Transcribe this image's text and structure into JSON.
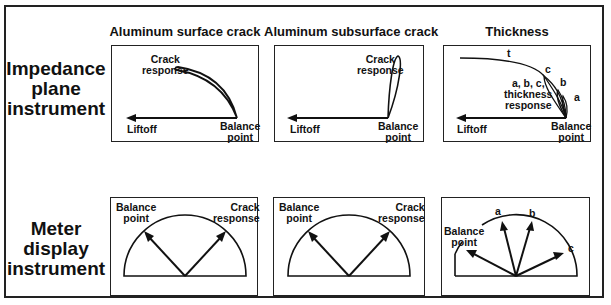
{
  "row_labels": {
    "impedance": [
      "Impedance",
      "plane",
      "instrument"
    ],
    "meter": [
      "Meter",
      "display",
      "instrument"
    ]
  },
  "column_titles": [
    "Aluminum surface crack",
    "Aluminum subsurface crack",
    "Thickness"
  ],
  "impedance_panels": {
    "surface": {
      "crack": [
        "Crack",
        "response"
      ],
      "liftoff": "Liftoff",
      "balance": [
        "Balance",
        "point"
      ]
    },
    "subsurface": {
      "crack": [
        "Crack",
        "response"
      ],
      "liftoff": "Liftoff",
      "balance": [
        "Balance",
        "point"
      ]
    },
    "thickness": {
      "t": "t",
      "c": "c",
      "b": "b",
      "a": "a",
      "response": [
        "a, b, c,",
        "thickness",
        "response"
      ],
      "liftoff": "Liftoff",
      "balance": [
        "Balance",
        "point"
      ]
    }
  },
  "meter_panels": {
    "surface": {
      "balance": [
        "Balance",
        "point"
      ],
      "crack": [
        "Crack",
        "response"
      ]
    },
    "subsurface": {
      "balance": [
        "Balance",
        "point"
      ],
      "crack": [
        "Crack",
        "response"
      ]
    },
    "thickness": {
      "balance": [
        "Balance",
        "point"
      ],
      "a": "a",
      "b": "b",
      "c": "c"
    }
  }
}
